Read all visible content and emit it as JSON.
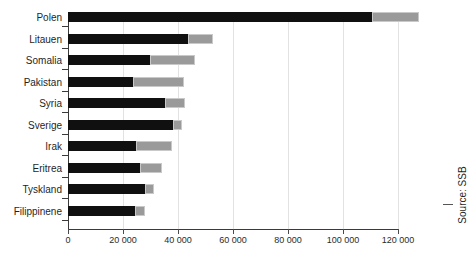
{
  "chart": {
    "title": "",
    "source_label": "Source: SSB",
    "axis": {
      "xlabel": "",
      "ylabel": "",
      "tick_labels": [
        "0",
        "20 000",
        "40 000",
        "60 000",
        "80 000",
        "100 000",
        "120 000"
      ],
      "tick_values": [
        0,
        20000,
        40000,
        60000,
        80000,
        100000,
        120000
      ]
    },
    "colors": {
      "series_dark": "#101010",
      "series_light": "#9a9a9a",
      "gridline": "#e2e2e2",
      "axis": "#3a3a3a",
      "text": "#1f1f1f"
    }
  },
  "chart_data": {
    "type": "bar",
    "orientation": "horizontal",
    "stacked": true,
    "title": "",
    "xlabel": "",
    "ylabel": "",
    "xlim": [
      0,
      130000
    ],
    "grid": true,
    "legend": "none",
    "categories": [
      "Polen",
      "Litauen",
      "Somalia",
      "Pakistan",
      "Syria",
      "Sverige",
      "Irak",
      "Eritrea",
      "Tyskland",
      "Filippinene"
    ],
    "series": [
      {
        "name": "series-1-dark",
        "color": "#101010",
        "values": [
          110500,
          43600,
          29800,
          23600,
          35300,
          38200,
          24700,
          26200,
          28000,
          24400
        ]
      },
      {
        "name": "series-2-light",
        "color": "#9a9a9a",
        "values": [
          17100,
          9100,
          16400,
          18500,
          7300,
          3300,
          13100,
          8000,
          3100,
          3600
        ]
      }
    ],
    "totals": [
      127600,
      52700,
      46200,
      42100,
      42600,
      41500,
      37800,
      34200,
      31100,
      28000
    ],
    "source": "SSB"
  }
}
